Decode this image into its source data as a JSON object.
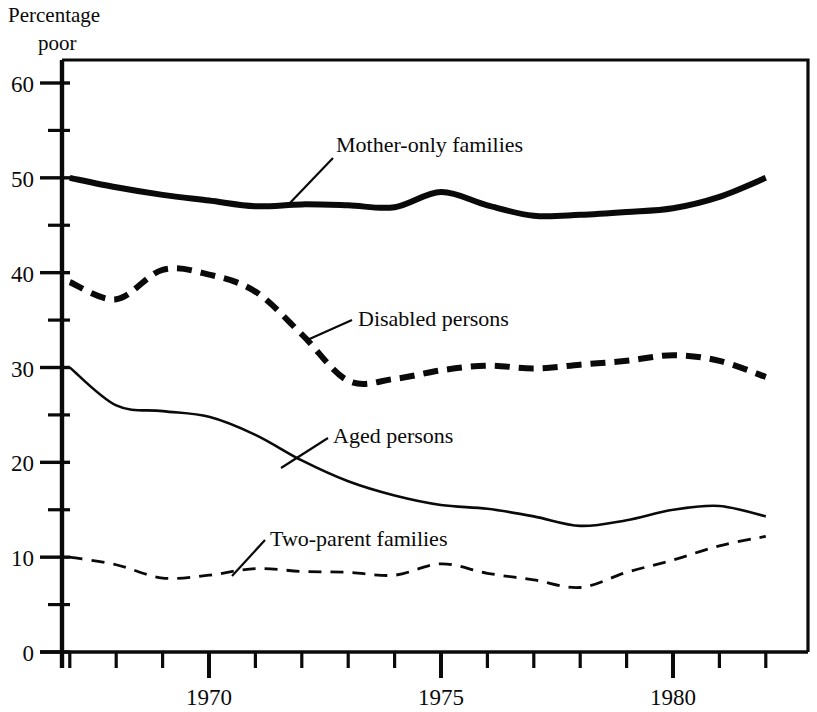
{
  "chart_data": {
    "type": "line",
    "title": "",
    "ylabel_line1": "Percentage",
    "ylabel_line2": "poor",
    "xlabel": "",
    "xlim": [
      1966.8,
      1982.6
    ],
    "ylim": [
      0,
      62
    ],
    "grid": false,
    "legend_position": "inline-annotations",
    "x_tick_labels": [
      "1970",
      "1975",
      "1980"
    ],
    "x_tick_values": [
      1970,
      1975,
      1980
    ],
    "x_minor_ticks": [
      1967,
      1968,
      1969,
      1971,
      1972,
      1973,
      1974,
      1976,
      1977,
      1978,
      1979,
      1981,
      1982
    ],
    "y_tick_labels": [
      "0",
      "10",
      "20",
      "30",
      "40",
      "50",
      "60"
    ],
    "y_tick_values": [
      0,
      10,
      20,
      30,
      40,
      50,
      60
    ],
    "y_minor_ticks": [
      5,
      15,
      25,
      35,
      45,
      55
    ],
    "x": [
      1967,
      1968,
      1969,
      1970,
      1971,
      1972,
      1973,
      1974,
      1975,
      1976,
      1977,
      1978,
      1979,
      1980,
      1981,
      1982
    ],
    "series": [
      {
        "name": "Mother-only families",
        "style": "thick-solid",
        "values": [
          50.0,
          49.0,
          48.2,
          47.6,
          47.0,
          47.2,
          47.1,
          46.9,
          48.5,
          47.1,
          46.0,
          46.1,
          46.4,
          46.8,
          48.0,
          50.0
        ]
      },
      {
        "name": "Disabled persons",
        "style": "thick-dashed",
        "values": [
          39.0,
          37.2,
          40.3,
          39.8,
          38.0,
          33.5,
          28.6,
          28.8,
          29.7,
          30.2,
          29.9,
          30.3,
          30.7,
          31.3,
          30.7,
          29.0
        ]
      },
      {
        "name": "Aged persons",
        "style": "thin-solid",
        "values": [
          30.0,
          26.0,
          25.4,
          24.8,
          22.9,
          20.2,
          18.0,
          16.5,
          15.5,
          15.1,
          14.3,
          13.3,
          13.9,
          15.0,
          15.4,
          14.3
        ]
      },
      {
        "name": "Two-parent families",
        "style": "thin-dashed",
        "values": [
          10.0,
          9.2,
          7.8,
          8.1,
          8.8,
          8.5,
          8.4,
          8.1,
          9.3,
          8.3,
          7.6,
          6.8,
          8.4,
          9.7,
          11.2,
          12.2
        ]
      }
    ],
    "annotations": [
      {
        "label": "Mother-only families",
        "label_x": 336,
        "label_y": 152,
        "leader_from_x": 333,
        "leader_from_y": 158,
        "leader_to_x": 288,
        "leader_to_y": 205
      },
      {
        "label": "Disabled persons",
        "label_x": 358,
        "label_y": 326,
        "leader_from_x": 352,
        "leader_from_y": 320,
        "leader_to_x": 305,
        "leader_to_y": 341
      },
      {
        "label": "Aged persons",
        "label_x": 333,
        "label_y": 443,
        "leader_from_x": 328,
        "leader_from_y": 438,
        "leader_to_x": 281,
        "leader_to_y": 468
      },
      {
        "label": "Two-parent families",
        "label_x": 270,
        "label_y": 546,
        "leader_from_x": 265,
        "leader_from_y": 540,
        "leader_to_x": 232,
        "leader_to_y": 576
      }
    ],
    "colors": {
      "ink": "#0a0a0a",
      "background": "#ffffff"
    }
  }
}
